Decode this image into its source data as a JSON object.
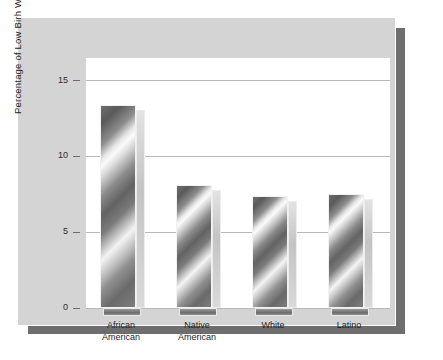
{
  "chart_data": {
    "type": "bar",
    "title": "",
    "xlabel": "",
    "ylabel": "Percentage of Low Birh Weight",
    "categories": [
      "African American",
      "Native American",
      "White",
      "Latino"
    ],
    "category_lines": [
      [
        "African",
        "American"
      ],
      [
        "Native",
        "American"
      ],
      [
        "White"
      ],
      [
        "Latino"
      ]
    ],
    "values": [
      13.4,
      8.1,
      7.4,
      7.5
    ],
    "ylim": [
      0,
      16.5
    ],
    "yticks": [
      0,
      5,
      10,
      15
    ],
    "ytick_labels": [
      "0",
      "5",
      "10",
      "15"
    ],
    "grid": true,
    "legend": "none",
    "series": [
      {
        "name": "Percentage of Low Birh Weight",
        "values": [
          13.4,
          8.1,
          7.4,
          7.5
        ]
      }
    ]
  },
  "figure": {
    "panel_color": "#d4d4d4",
    "plot_background": "#ffffff",
    "shadow_color": "#6e6e6e",
    "gridline_color": "#b9b9b9",
    "bar_fill": "#7a7a7a",
    "text_color": "#1e1e1e"
  }
}
